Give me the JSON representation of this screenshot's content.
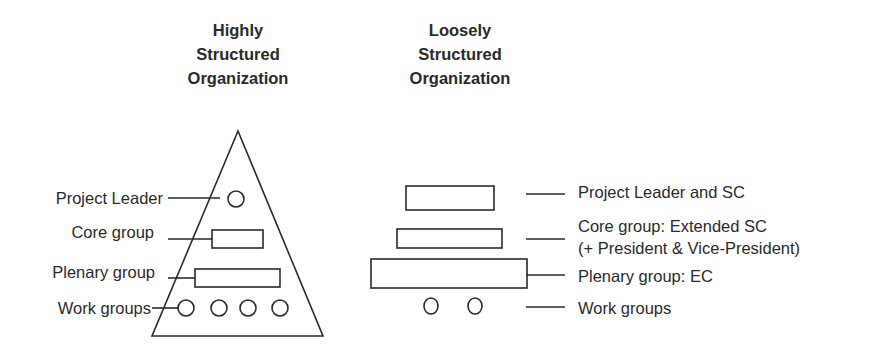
{
  "left_diagram": {
    "title_lines": [
      "Highly",
      "Structured",
      "Organization"
    ],
    "labels": {
      "project_leader": "Project Leader",
      "core_group": "Core group",
      "plenary_group": "Plenary group",
      "work_groups": "Work groups"
    }
  },
  "right_diagram": {
    "title_lines": [
      "Loosely",
      "Structured",
      "Organization"
    ],
    "labels": {
      "project_leader": "Project Leader and SC",
      "core_group_line1": "Core group: Extended SC",
      "core_group_line2": "(+ President & Vice-President)",
      "plenary_group": "Plenary group: EC",
      "work_groups": "Work groups"
    }
  },
  "colors": {
    "stroke": "#2a2a2a",
    "background": "#ffffff"
  }
}
